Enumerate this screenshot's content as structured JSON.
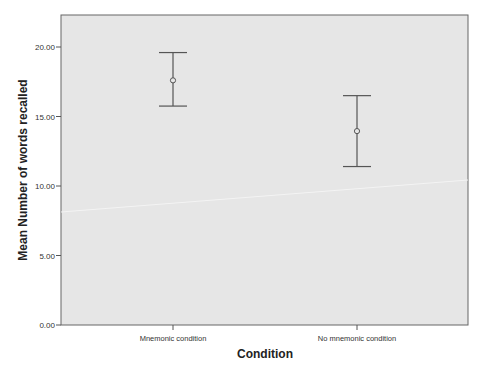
{
  "chart_data": {
    "type": "errorbar",
    "title": "",
    "xlabel": "Condition",
    "ylabel": "Mean Number of words recalled",
    "categories": [
      "Mnemonic condition",
      "No mnemonic condition"
    ],
    "series": [
      {
        "name": "Mean Number of words recalled",
        "values": [
          17.6,
          13.95
        ],
        "error_upper": [
          19.6,
          16.5
        ],
        "error_lower": [
          15.75,
          11.4
        ]
      }
    ],
    "yticks": [
      "0.00",
      "5.00",
      "10.00",
      "15.00",
      "20.00"
    ],
    "ylim": [
      0,
      22.2
    ],
    "grid": false,
    "legend": "none",
    "colors": {
      "plot_bg": "#e6e6e6",
      "line": "#555555"
    }
  }
}
